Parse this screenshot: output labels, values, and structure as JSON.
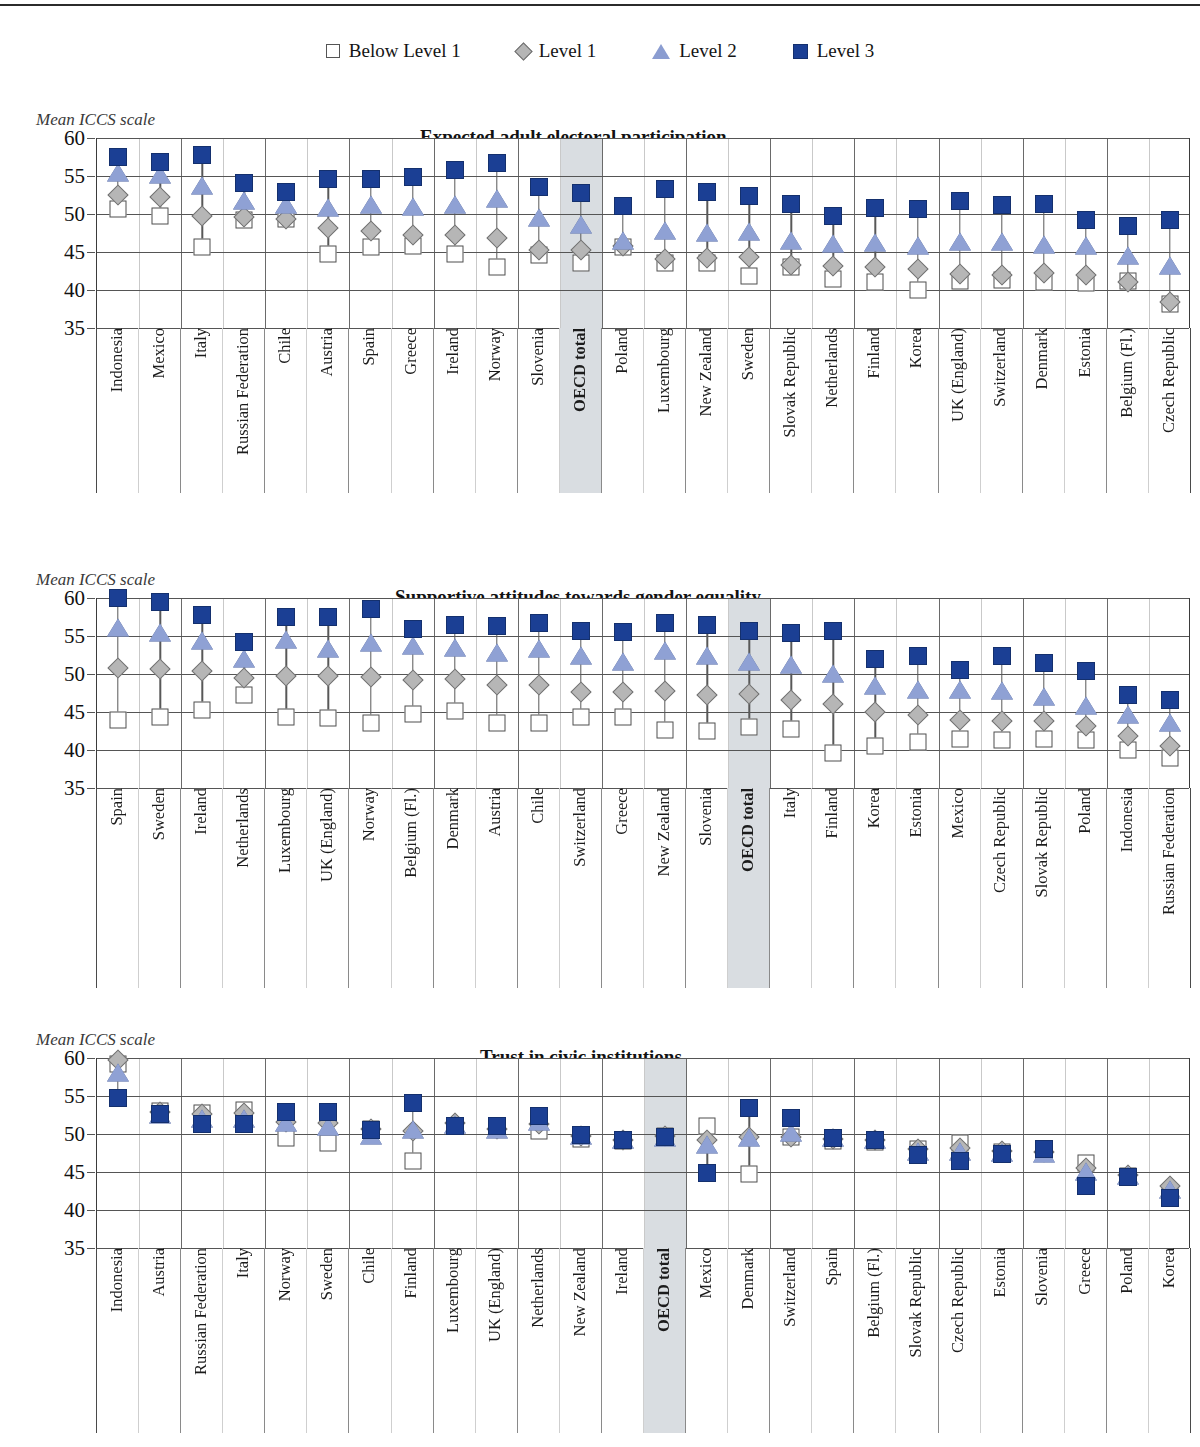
{
  "legend": {
    "items": [
      {
        "label": "Below Level 1",
        "marker": "square-open-icon",
        "color": "#ffffff"
      },
      {
        "label": "Level 1",
        "marker": "diamond-grey-icon",
        "color": "#b6b6b6"
      },
      {
        "label": "Level 2",
        "marker": "triangle-blue-icon",
        "color": "#8fa1d4"
      },
      {
        "label": "Level 3",
        "marker": "square-filled-icon",
        "color": "#1b3f94"
      }
    ]
  },
  "axis_caption": "Mean ICCS scale",
  "y_ticks": [
    "60",
    "55",
    "50",
    "45",
    "40",
    "35"
  ],
  "highlight_label": "OECD total",
  "chart_data": [
    {
      "type": "scatter",
      "title": "Expected adult electoral participation",
      "ylabel": "Mean ICCS scale",
      "xlabel": "",
      "ylim": [
        35,
        60
      ],
      "yticks": [
        35,
        40,
        45,
        50,
        55,
        60
      ],
      "grid": true,
      "legend_position": "top-center",
      "highlight_category": "OECD total",
      "categories": [
        "Indonesia",
        "Mexico",
        "Italy",
        "Russian Federation",
        "Chile",
        "Austria",
        "Spain",
        "Greece",
        "Ireland",
        "Norway",
        "Slovenia",
        "OECD total",
        "Poland",
        "Luxembourg",
        "New Zealand",
        "Sweden",
        "Slovak Republic",
        "Netherlands",
        "Finland",
        "Korea",
        "UK (England)",
        "Switzerland",
        "Denmark",
        "Estonia",
        "Belgium (Fl.)",
        "Czech Republic"
      ],
      "series": [
        {
          "name": "Below Level 1",
          "values": [
            50.6,
            49.8,
            45.6,
            49.2,
            49.3,
            44.7,
            45.6,
            45.8,
            44.8,
            43.0,
            44.6,
            43.5,
            45.6,
            43.6,
            43.6,
            41.9,
            43.0,
            41.5,
            41.1,
            40.0,
            41.2,
            41.3,
            41.1,
            40.9,
            41.2,
            38.1
          ]
        },
        {
          "name": "Level 1",
          "values": [
            52.5,
            52.3,
            49.8,
            49.6,
            49.4,
            48.1,
            47.8,
            47.2,
            47.3,
            46.9,
            45.3,
            45.3,
            45.8,
            44.1,
            44.2,
            44.3,
            43.3,
            43.2,
            43.0,
            42.8,
            42.1,
            42.0,
            42.2,
            42.0,
            41.0,
            38.4
          ]
        },
        {
          "name": "Level 2",
          "values": [
            55.3,
            55.0,
            53.5,
            51.6,
            51.1,
            50.7,
            51.1,
            50.8,
            51.0,
            51.8,
            49.4,
            48.4,
            46.3,
            47.6,
            47.4,
            47.5,
            46.3,
            45.9,
            46.0,
            45.6,
            46.2,
            46.2,
            45.8,
            45.7,
            44.3,
            43.0
          ]
        },
        {
          "name": "Level 3",
          "values": [
            57.5,
            56.8,
            57.8,
            54.1,
            52.9,
            54.6,
            54.6,
            54.9,
            55.8,
            56.7,
            53.6,
            52.8,
            51.0,
            53.3,
            52.9,
            52.4,
            51.3,
            49.8,
            50.8,
            50.7,
            51.7,
            51.2,
            51.3,
            49.2,
            48.4,
            49.2
          ]
        }
      ]
    },
    {
      "type": "scatter",
      "title": "Supportive attitudes towards gender equality",
      "ylabel": "Mean ICCS scale",
      "xlabel": "",
      "ylim": [
        35,
        60
      ],
      "yticks": [
        35,
        40,
        45,
        50,
        55,
        60
      ],
      "grid": true,
      "legend_position": "top-center",
      "highlight_category": "OECD total",
      "categories": [
        "Spain",
        "Sweden",
        "Ireland",
        "Netherlands",
        "Luxembourg",
        "UK (England)",
        "Norway",
        "Belgium (Fl.)",
        "Denmark",
        "Austria",
        "Chile",
        "Switzerland",
        "Greece",
        "New Zealand",
        "Slovenia",
        "OECD total",
        "Italy",
        "Finland",
        "Korea",
        "Estonia",
        "Mexico",
        "Czech Republic",
        "Slovak Republic",
        "Poland",
        "Indonesia",
        "Russian Federation"
      ],
      "series": [
        {
          "name": "Below Level 1",
          "values": [
            43.9,
            44.3,
            45.3,
            47.3,
            44.3,
            44.2,
            43.5,
            44.7,
            45.1,
            43.5,
            43.6,
            44.4,
            44.4,
            42.6,
            42.5,
            43.0,
            42.7,
            39.6,
            40.5,
            41.0,
            41.5,
            41.3,
            41.5,
            41.3,
            40.0,
            38.9
          ]
        },
        {
          "name": "Level 1",
          "values": [
            50.8,
            50.6,
            50.4,
            49.5,
            49.8,
            49.8,
            49.6,
            49.2,
            49.3,
            48.5,
            48.5,
            47.6,
            47.6,
            47.7,
            47.3,
            47.4,
            46.6,
            46.0,
            45.0,
            44.6,
            44.0,
            43.8,
            43.8,
            43.2,
            41.9,
            40.5
          ]
        },
        {
          "name": "Level 2",
          "values": [
            55.9,
            55.3,
            54.2,
            51.8,
            54.3,
            53.2,
            54.0,
            53.5,
            53.3,
            52.6,
            53.1,
            52.2,
            51.4,
            52.9,
            52.3,
            51.5,
            51.1,
            49.9,
            48.3,
            47.8,
            47.8,
            47.6,
            46.8,
            45.6,
            44.5,
            43.4
          ]
        },
        {
          "name": "Level 3",
          "values": [
            60.0,
            59.5,
            57.8,
            54.2,
            57.5,
            57.5,
            58.5,
            55.9,
            56.5,
            56.3,
            56.7,
            55.7,
            55.5,
            56.7,
            56.4,
            55.6,
            55.4,
            55.7,
            52.0,
            52.4,
            50.5,
            52.4,
            51.5,
            50.4,
            47.2,
            46.6
          ]
        }
      ]
    },
    {
      "type": "scatter",
      "title": "Trust in civic institutions",
      "ylabel": "Mean ICCS scale",
      "xlabel": "",
      "ylim": [
        35,
        60
      ],
      "yticks": [
        35,
        40,
        45,
        50,
        55,
        60
      ],
      "grid": true,
      "legend_position": "top-center",
      "highlight_category": "OECD total",
      "categories": [
        "Indonesia",
        "Austria",
        "Russian Federation",
        "Italy",
        "Norway",
        "Sweden",
        "Chile",
        "Finland",
        "Luxembourg",
        "UK (England)",
        "Netherlands",
        "New Zealand",
        "Ireland",
        "OECD total",
        "Mexico",
        "Denmark",
        "Switzerland",
        "Spain",
        "Belgium (Fl.)",
        "Slovak Republic",
        "Czech Republic",
        "Estonia",
        "Slovenia",
        "Greece",
        "Poland",
        "Korea"
      ],
      "series": [
        {
          "name": "Below Level 1",
          "values": [
            59.2,
            53.0,
            52.8,
            53.2,
            49.5,
            48.8,
            50.7,
            46.5,
            51.0,
            50.7,
            50.4,
            49.4,
            49.1,
            49.7,
            51.0,
            44.8,
            49.6,
            49.1,
            48.9,
            48.0,
            48.8,
            47.6,
            47.6,
            46.2,
            44.5,
            42.2
          ]
        },
        {
          "name": "Level 1",
          "values": [
            59.8,
            52.9,
            52.6,
            52.8,
            51.6,
            51.4,
            50.6,
            50.4,
            51.4,
            50.6,
            51.3,
            49.8,
            49.2,
            49.8,
            49.2,
            49.6,
            49.6,
            49.4,
            49.2,
            48.0,
            48.2,
            47.8,
            47.6,
            45.5,
            44.6,
            43.1
          ]
        },
        {
          "name": "Level 2",
          "values": [
            57.9,
            52.4,
            51.9,
            51.9,
            51.3,
            50.8,
            49.6,
            50.4,
            51.0,
            50.4,
            51.5,
            49.6,
            49.1,
            49.4,
            48.4,
            49.3,
            50.0,
            49.3,
            49.1,
            47.5,
            47.5,
            47.4,
            47.2,
            44.9,
            44.3,
            42.5
          ]
        },
        {
          "name": "Level 3",
          "values": [
            54.8,
            52.6,
            51.3,
            51.3,
            52.9,
            52.9,
            50.5,
            54.1,
            51.1,
            51.0,
            52.4,
            49.9,
            49.2,
            49.6,
            44.9,
            53.4,
            52.1,
            49.5,
            49.2,
            47.2,
            46.4,
            47.4,
            48.0,
            43.2,
            44.3,
            41.6
          ]
        }
      ]
    }
  ]
}
